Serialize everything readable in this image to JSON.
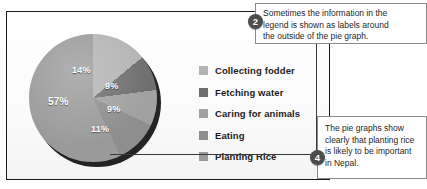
{
  "chart_data": {
    "type": "pie",
    "title": "",
    "categories": [
      "Collecting fodder",
      "Fetching water",
      "Caring for animals",
      "Eating",
      "Planting Rice"
    ],
    "values": [
      14,
      9,
      9,
      11,
      57
    ],
    "labels": [
      "14%",
      "9%",
      "9%",
      "11%",
      "57%"
    ],
    "unit": "%",
    "colors": [
      "#b3b3b3",
      "#6e6e6e",
      "#a0a0a0",
      "#8e8e8e",
      "#9a9a9a"
    ],
    "legend_position": "right",
    "grid": false,
    "start_angle_deg": 0,
    "direction": "clockwise"
  },
  "legend": {
    "items": [
      {
        "label": "Collecting fodder",
        "color": "#b3b3b3"
      },
      {
        "label": "Fetching water",
        "color": "#6e6e6e"
      },
      {
        "label": "Caring for animals",
        "color": "#a0a0a0"
      },
      {
        "label": "Eating",
        "color": "#8e8e8e"
      },
      {
        "label": "Planting Rice",
        "color": "#9a9a9a"
      }
    ]
  },
  "annotations": [
    {
      "marker": "2",
      "lines": [
        "Sometimes the information in the",
        "legend is shown as labels around",
        "the outside of the pie graph."
      ]
    },
    {
      "marker": "4",
      "lines": [
        "The pie graphs show",
        "clearly that planting rice",
        "is likely to be important",
        "in Nepal."
      ]
    }
  ]
}
